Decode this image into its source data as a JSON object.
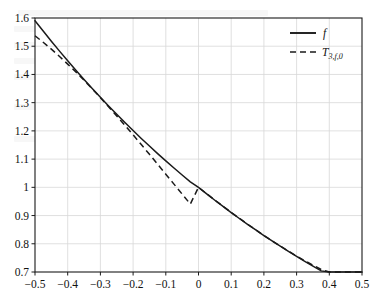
{
  "figure": {
    "background_color": "#ffffff",
    "axis_color": "#1a1a1a",
    "grid_color": "#d8d8d8",
    "curve_color": "#1a1a1a"
  },
  "legend": {
    "position": "top-right",
    "entries": [
      {
        "label": "f",
        "style": "solid",
        "name": "function-f"
      },
      {
        "label": "T",
        "sub": "3,f,0",
        "style": "dashed",
        "name": "taylor-polynomial-t3"
      }
    ]
  },
  "chart_data": {
    "type": "line",
    "title": "",
    "subtitle": "",
    "xlabel": "",
    "ylabel": "",
    "xlim": [
      -0.5,
      0.5
    ],
    "ylim": [
      0.7,
      1.6
    ],
    "grid": true,
    "legend_position": "top-right",
    "xticks": [
      -0.5,
      -0.4,
      -0.3,
      -0.2,
      -0.1,
      0,
      0.1,
      0.2,
      0.3,
      0.4,
      0.5
    ],
    "xticklabels": [
      "−0.5",
      "−0.4",
      "−0.3",
      "−0.2",
      "−0.1",
      "0",
      "0.1",
      "0.2",
      "0.3",
      "0.4",
      "0.5"
    ],
    "yticks": [
      0.7,
      0.8,
      0.9,
      1,
      1.1,
      1.2,
      1.3,
      1.4,
      1.5,
      1.6
    ],
    "yticklabels": [
      "0.7",
      "0.8",
      "0.9",
      "1",
      "1.1",
      "1.2",
      "1.3",
      "1.4",
      "1.5",
      "1.6"
    ],
    "x": [
      -0.5,
      -0.475,
      -0.45,
      -0.425,
      -0.4,
      -0.375,
      -0.35,
      -0.325,
      -0.3,
      -0.275,
      -0.25,
      -0.225,
      -0.2,
      -0.175,
      -0.15,
      -0.125,
      -0.1,
      -0.075,
      -0.05,
      -0.025,
      0,
      0.025,
      0.05,
      0.075,
      0.1,
      0.125,
      0.15,
      0.175,
      0.2,
      0.225,
      0.25,
      0.275,
      0.3,
      0.325,
      0.35,
      0.375,
      0.4,
      0.425,
      0.45,
      0.475,
      0.5
    ],
    "series": [
      {
        "name": "f",
        "style": "solid",
        "values": [
          1.5905,
          1.5537,
          1.5177,
          1.4826,
          1.4483,
          1.4148,
          1.3821,
          1.3501,
          1.3189,
          1.2884,
          1.2586,
          1.2295,
          1.2011,
          1.1733,
          1.1462,
          1.1196,
          1.0937,
          1.0684,
          1.0437,
          1.0196,
          1.0,
          0.9769,
          0.9543,
          0.9322,
          0.9107,
          0.8896,
          0.869,
          0.8489,
          0.8292,
          0.8101,
          0.7913,
          0.773,
          0.7551,
          0.7376,
          0.7206,
          0.7039,
          0.6876,
          0.6717,
          0.6562,
          0.641,
          0.6262
        ]
      },
      {
        "name": "T_3,f,0",
        "style": "dashed",
        "values": [
          1.5371,
          1.5141,
          1.4896,
          1.4638,
          1.4367,
          1.4085,
          1.3792,
          1.3489,
          1.3178,
          1.2858,
          1.2531,
          1.2198,
          1.1859,
          1.1516,
          1.1169,
          1.0819,
          1.0467,
          1.0114,
          0.9761,
          0.9408,
          1.0,
          0.9773,
          0.9549,
          0.9329,
          0.9113,
          0.8901,
          0.8694,
          0.8492,
          0.8295,
          0.8103,
          0.7918,
          0.7739,
          0.7566,
          0.74,
          0.7242,
          0.7091,
          0.6948,
          0.6813,
          0.6687,
          0.6569,
          0.6461
        ]
      }
    ]
  },
  "plot_geometry": {
    "left_px": 35,
    "right_px": 362,
    "top_px": 18,
    "bottom_px": 272
  }
}
